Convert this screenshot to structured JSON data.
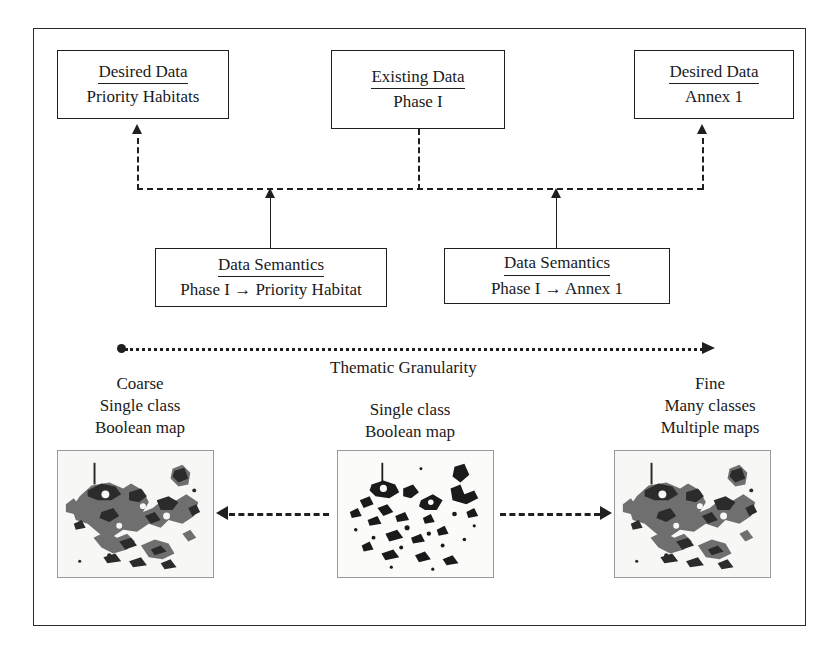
{
  "figure": {
    "top_boxes": [
      {
        "title": "Desired Data",
        "body": "Priority Habitats"
      },
      {
        "title": "Existing Data",
        "body": "Phase I"
      },
      {
        "title": "Desired Data",
        "body": "Annex 1"
      }
    ],
    "semantics_boxes": [
      {
        "title": "Data Semantics",
        "body": "Phase I → Priority Habitat"
      },
      {
        "title": "Data Semantics",
        "body": "Phase I → Annex 1"
      }
    ],
    "axis": {
      "label": "Thematic Granularity",
      "start_label": "Coarse",
      "end_label": "Fine",
      "direction": "left-to-right"
    },
    "captions": [
      {
        "l1": "Coarse",
        "l2": "Single class",
        "l3": "Boolean map"
      },
      {
        "l1": "Single class",
        "l2": "Boolean map",
        "l3": ""
      },
      {
        "l1": "Fine",
        "l2": "Many classes",
        "l3": "Multiple maps"
      }
    ],
    "colors": {
      "line": "#1f1f1f",
      "frame": "#2a2a2a",
      "map_background": "#f7f7f5",
      "map_dark": "#2b2b2b",
      "map_gray": "#6f6f6f"
    }
  }
}
